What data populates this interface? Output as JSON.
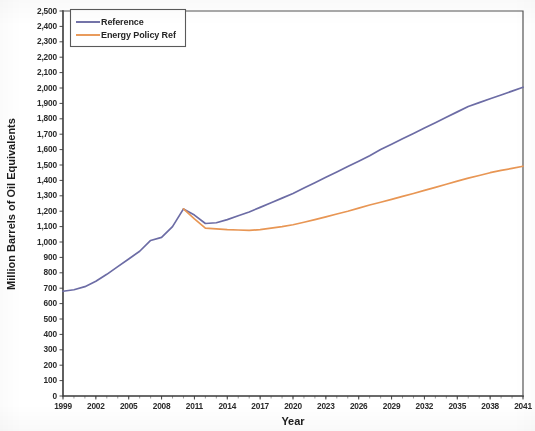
{
  "chart_data": {
    "type": "line",
    "title": "",
    "xlabel": "Year",
    "ylabel": "Million Barrels of Oil Equivalents",
    "xlim": [
      1999,
      2041
    ],
    "ylim": [
      0,
      2500
    ],
    "ytick_step": 100,
    "grid": false,
    "legend_position": "top-left",
    "xtick_labels": [
      "1999",
      "2002",
      "2005",
      "2008",
      "2011",
      "2014",
      "2017",
      "2020",
      "2023",
      "2026",
      "2029",
      "2032",
      "2035",
      "2038",
      "2041"
    ],
    "xtick_values": [
      1999,
      2002,
      2005,
      2008,
      2011,
      2014,
      2017,
      2020,
      2023,
      2026,
      2029,
      2032,
      2035,
      2038,
      2041
    ],
    "ytick_labels": [
      "0",
      "100",
      "200",
      "300",
      "400",
      "500",
      "600",
      "700",
      "800",
      "900",
      "1,000",
      "1,100",
      "1,200",
      "1,300",
      "1,400",
      "1,500",
      "1,600",
      "1,700",
      "1,800",
      "1,900",
      "2,000",
      "2,100",
      "2,200",
      "2,300",
      "2,400",
      "2,500"
    ],
    "ytick_values": [
      0,
      100,
      200,
      300,
      400,
      500,
      600,
      700,
      800,
      900,
      1000,
      1100,
      1200,
      1300,
      1400,
      1500,
      1600,
      1700,
      1800,
      1900,
      2000,
      2100,
      2200,
      2300,
      2400,
      2500
    ],
    "x": [
      1999,
      2000,
      2001,
      2002,
      2003,
      2004,
      2005,
      2006,
      2007,
      2008,
      2009,
      2010,
      2011,
      2012,
      2013,
      2014,
      2015,
      2016,
      2017,
      2018,
      2019,
      2020,
      2021,
      2022,
      2023,
      2024,
      2025,
      2026,
      2027,
      2028,
      2029,
      2030,
      2031,
      2032,
      2033,
      2034,
      2035,
      2036,
      2037,
      2038,
      2039,
      2040,
      2041
    ],
    "series": [
      {
        "name": "Reference",
        "color": "#6C6CA5",
        "values": [
          680,
          690,
          710,
          745,
          790,
          840,
          890,
          940,
          1010,
          1030,
          1100,
          1215,
          1175,
          1120,
          1125,
          1145,
          1170,
          1195,
          1225,
          1255,
          1285,
          1315,
          1350,
          1385,
          1420,
          1455,
          1490,
          1525,
          1560,
          1600,
          1635,
          1670,
          1705,
          1740,
          1775,
          1810,
          1845,
          1880,
          1905,
          1930,
          1955,
          1980,
          2005
        ]
      },
      {
        "name": "Energy Policy Ref",
        "color": "#E89654",
        "values": [
          null,
          null,
          null,
          null,
          null,
          null,
          null,
          null,
          null,
          null,
          null,
          1215,
          1150,
          1090,
          1085,
          1080,
          1078,
          1075,
          1080,
          1090,
          1100,
          1112,
          1128,
          1145,
          1163,
          1182,
          1200,
          1220,
          1240,
          1258,
          1277,
          1296,
          1315,
          1335,
          1355,
          1375,
          1395,
          1415,
          1432,
          1450,
          1465,
          1478,
          1492
        ]
      }
    ]
  },
  "legend": {
    "items": [
      {
        "label": "Reference",
        "color": "#6C6CA5"
      },
      {
        "label": "Energy Policy Ref",
        "color": "#E89654"
      }
    ]
  },
  "axes": {
    "x_title": "Year",
    "y_title": "Million Barrels of Oil Equivalents"
  }
}
